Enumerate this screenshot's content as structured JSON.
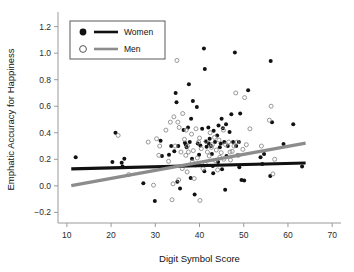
{
  "chart_data": {
    "type": "scatter",
    "title": "",
    "xlabel": "Digit Symbol Score",
    "ylabel": "Emphatic Accuracy for Happiness",
    "xlim": [
      8,
      72
    ],
    "ylim": [
      -0.28,
      1.28
    ],
    "xticks": [
      10,
      20,
      30,
      40,
      50,
      60,
      70
    ],
    "xtick_labels": [
      "10",
      "20",
      "30",
      "40",
      "50",
      "60",
      "70"
    ],
    "yticks": [
      -0.2,
      0.0,
      0.2,
      0.4,
      0.6,
      0.8,
      1.0,
      1.2
    ],
    "ytick_labels": [
      "-0.2",
      "0.0",
      "0.2",
      "0.4",
      "0.6",
      "0.8",
      "1.0",
      "1.2"
    ],
    "grid": false,
    "legend_position": "upper-left",
    "legend_entries": [
      {
        "name": "Women",
        "marker": "filled-circle",
        "color": "#111111",
        "line_color": "#111111"
      },
      {
        "name": "Men",
        "marker": "open-circle",
        "color": "#8c8c8c",
        "line_color": "#8c8c8c"
      }
    ],
    "series": [
      {
        "name": "Women",
        "marker": "filled-circle",
        "color": "#111111",
        "points": [
          [
            12.0,
            0.215
          ],
          [
            21.0,
            0.4
          ],
          [
            20.3,
            0.18
          ],
          [
            22.4,
            0.175
          ],
          [
            23.0,
            0.205
          ],
          [
            22.6,
            0.145
          ],
          [
            27.3,
            0.02
          ],
          [
            29.9,
            -0.115
          ],
          [
            31.2,
            0.34
          ],
          [
            31.5,
            0.225
          ],
          [
            33.1,
            0.235
          ],
          [
            34.6,
            0.7
          ],
          [
            34.8,
            0.63
          ],
          [
            34.3,
            0.26
          ],
          [
            35.2,
            0.3
          ],
          [
            35.0,
            0.03
          ],
          [
            35.6,
            -0.02
          ],
          [
            36.4,
            0.42
          ],
          [
            36.7,
            0.325
          ],
          [
            36.9,
            0.31
          ],
          [
            37.1,
            0.29
          ],
          [
            37.6,
            0.765
          ],
          [
            37.4,
            0.44
          ],
          [
            37.8,
            0.33
          ],
          [
            38.1,
            0.505
          ],
          [
            38.3,
            0.205
          ],
          [
            38.5,
            0.64
          ],
          [
            38.0,
            0.06
          ],
          [
            38.9,
            -0.065
          ],
          [
            39.4,
            0.595
          ],
          [
            39.6,
            0.32
          ],
          [
            39.1,
            0.155
          ],
          [
            40.2,
            0.305
          ],
          [
            40.6,
            0.43
          ],
          [
            41.0,
            1.035
          ],
          [
            41.2,
            0.88
          ],
          [
            41.4,
            0.335
          ],
          [
            41.6,
            0.295
          ],
          [
            41.1,
            0.11
          ],
          [
            42.0,
            0.44
          ],
          [
            42.3,
            0.355
          ],
          [
            42.6,
            0.3
          ],
          [
            42.8,
            0.24
          ],
          [
            43.0,
            0.15
          ],
          [
            43.2,
            0.415
          ],
          [
            43.5,
            0.33
          ],
          [
            43.1,
            0.095
          ],
          [
            44.0,
            0.38
          ],
          [
            44.3,
            0.455
          ],
          [
            44.6,
            0.29
          ],
          [
            44.2,
            0.18
          ],
          [
            45.0,
            0.505
          ],
          [
            45.3,
            0.435
          ],
          [
            45.6,
            0.33
          ],
          [
            45.1,
            0.125
          ],
          [
            46.0,
            0.465
          ],
          [
            46.4,
            0.3
          ],
          [
            46.1,
            0.225
          ],
          [
            45.8,
            -0.03
          ],
          [
            47.2,
            0.54
          ],
          [
            47.6,
            0.33
          ],
          [
            48.0,
            1.005
          ],
          [
            48.3,
            0.3
          ],
          [
            48.6,
            0.23
          ],
          [
            49.2,
            0.545
          ],
          [
            49.0,
            0.14
          ],
          [
            49.5,
            0.045
          ],
          [
            50.1,
            0.04
          ],
          [
            51.0,
            0.72
          ],
          [
            53.8,
            0.215
          ],
          [
            54.2,
            0.165
          ],
          [
            54.6,
            0.24
          ],
          [
            56.1,
            0.94
          ],
          [
            56.4,
            0.48
          ],
          [
            56.0,
            0.075
          ],
          [
            59.0,
            0.315
          ],
          [
            61.2,
            0.465
          ],
          [
            63.2,
            0.145
          ],
          [
            33.6,
            0.3
          ],
          [
            39.9,
            0.235
          ],
          [
            42.1,
            0.32
          ],
          [
            44.8,
            0.32
          ],
          [
            46.8,
            0.405
          ],
          [
            48.9,
            0.33
          ]
        ]
      },
      {
        "name": "Men",
        "marker": "open-circle",
        "color": "#8c8c8c",
        "points": [
          [
            21.6,
            0.38
          ],
          [
            24.0,
            0.085
          ],
          [
            28.4,
            0.33
          ],
          [
            29.6,
            0.005
          ],
          [
            30.3,
            0.355
          ],
          [
            30.8,
            0.23
          ],
          [
            31.0,
            0.3
          ],
          [
            32.4,
            0.42
          ],
          [
            33.0,
            0.185
          ],
          [
            33.4,
            0.48
          ],
          [
            33.8,
            -0.105
          ],
          [
            34.2,
            0.52
          ],
          [
            34.0,
            0.015
          ],
          [
            34.9,
            0.945
          ],
          [
            35.1,
            0.48
          ],
          [
            35.4,
            0.44
          ],
          [
            35.8,
            0.255
          ],
          [
            35.3,
            0.045
          ],
          [
            36.2,
            0.545
          ],
          [
            36.6,
            0.35
          ],
          [
            36.1,
            0.13
          ],
          [
            37.0,
            0.42
          ],
          [
            37.3,
            0.3
          ],
          [
            37.5,
            0.255
          ],
          [
            37.2,
            0.105
          ],
          [
            38.2,
            0.39
          ],
          [
            38.6,
            0.265
          ],
          [
            38.4,
            0.18
          ],
          [
            38.8,
            0.055
          ],
          [
            39.2,
            0.43
          ],
          [
            39.8,
            0.33
          ],
          [
            39.5,
            0.21
          ],
          [
            40.0,
            0.36
          ],
          [
            40.4,
            0.28
          ],
          [
            40.8,
            0.13
          ],
          [
            40.1,
            -0.11
          ],
          [
            41.5,
            0.335
          ],
          [
            41.8,
            0.255
          ],
          [
            41.3,
            0.165
          ],
          [
            42.4,
            0.4
          ],
          [
            42.9,
            0.31
          ],
          [
            42.2,
            0.225
          ],
          [
            43.4,
            0.365
          ],
          [
            43.8,
            0.27
          ],
          [
            43.6,
            0.19
          ],
          [
            44.4,
            0.345
          ],
          [
            44.9,
            0.25
          ],
          [
            44.1,
            0.12
          ],
          [
            45.4,
            0.42
          ],
          [
            45.9,
            0.31
          ],
          [
            45.5,
            0.2
          ],
          [
            46.6,
            0.33
          ],
          [
            46.9,
            0.255
          ],
          [
            47.0,
            0.195
          ],
          [
            47.8,
            0.3
          ],
          [
            48.2,
            0.7
          ],
          [
            48.5,
            0.33
          ],
          [
            48.8,
            0.23
          ],
          [
            49.8,
            0.275
          ],
          [
            50.2,
            0.665
          ],
          [
            50.6,
            0.31
          ],
          [
            51.4,
            0.43
          ],
          [
            54.0,
            0.3
          ],
          [
            55.8,
            0.495
          ],
          [
            56.2,
            0.6
          ],
          [
            56.6,
            0.09
          ],
          [
            57.0,
            0.2
          ],
          [
            34.5,
            0.3
          ],
          [
            36.9,
            0.23
          ],
          [
            42.7,
            0.29
          ],
          [
            44.6,
            0.215
          ],
          [
            47.4,
            0.26
          ]
        ]
      }
    ],
    "trendlines": [
      {
        "name": "Women",
        "color": "#111111",
        "x0": 11.0,
        "y0": 0.128,
        "x1": 64.0,
        "y1": 0.172,
        "width": 3.2
      },
      {
        "name": "Men",
        "color": "#8c8c8c",
        "x0": 11.0,
        "y0": 0.002,
        "x1": 64.0,
        "y1": 0.322,
        "width": 3.2
      }
    ]
  }
}
